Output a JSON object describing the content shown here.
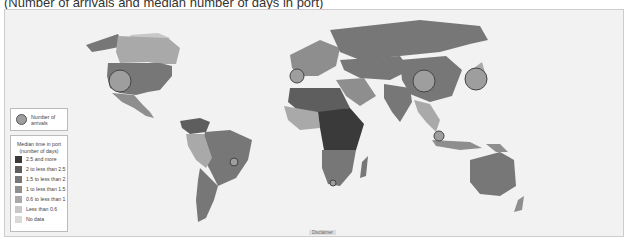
{
  "title": "(Number of arrivals and median number of days in port)",
  "legend": {
    "arrivals_label": "Number of arrivals",
    "median_header_line1": "Median time in port",
    "median_header_line2": "(number of days)",
    "categories": [
      {
        "label": "2.5 and more",
        "color": "#3a3a3a"
      },
      {
        "label": "2 to less than 2.5",
        "color": "#5e5e5e"
      },
      {
        "label": "1.5 to less than 2",
        "color": "#777777"
      },
      {
        "label": "1 to less than 1.5",
        "color": "#8e8e8e"
      },
      {
        "label": "0.6 to less than 1",
        "color": "#a9a9a9"
      },
      {
        "label": "Less than 0.6",
        "color": "#c8c8c8"
      },
      {
        "label": "No data",
        "color": "#d9d9d9"
      }
    ]
  },
  "disclaimer": "Disclaimer",
  "bubbles": [
    {
      "region": "United States",
      "x": 120,
      "y": 81,
      "r": 11
    },
    {
      "region": "Spain",
      "x": 297,
      "y": 76,
      "r": 7
    },
    {
      "region": "China",
      "x": 424,
      "y": 81,
      "r": 11
    },
    {
      "region": "Japan",
      "x": 476,
      "y": 79,
      "r": 11
    },
    {
      "region": "Singapore",
      "x": 439,
      "y": 136,
      "r": 5
    },
    {
      "region": "Brazil",
      "x": 234,
      "y": 162,
      "r": 4
    },
    {
      "region": "South Africa",
      "x": 333,
      "y": 183,
      "r": 3
    }
  ]
}
